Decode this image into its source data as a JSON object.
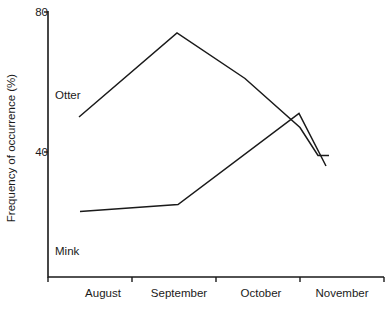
{
  "chart_data": {
    "type": "line",
    "title": "",
    "xlabel": "",
    "ylabel": "Frequency of occurrence (%)",
    "categories": [
      "August",
      "September",
      "October",
      "November"
    ],
    "x_tick_labels": [
      "August",
      "September",
      "October",
      "November"
    ],
    "y_tick_labels": [
      "80",
      "40"
    ],
    "y_ticks": [
      80,
      40
    ],
    "ylim": [
      19,
      80
    ],
    "grid": false,
    "legend_position": "inline-annotation",
    "series": [
      {
        "name": "Otter",
        "label": "Otter",
        "color": "#1a1a1a",
        "x": [
          "August",
          "September",
          "October",
          "October-late",
          "November-mid",
          "November"
        ],
        "values": [
          50,
          74,
          61,
          47,
          39,
          39
        ]
      },
      {
        "name": "Mink",
        "label": "Mink",
        "color": "#1a1a1a",
        "x": [
          "August",
          "September",
          "October-late",
          "November"
        ],
        "values": [
          23,
          25,
          51,
          36
        ]
      }
    ],
    "annotations": [
      {
        "text": "Otter",
        "series": "Otter"
      },
      {
        "text": "Mink",
        "series": "Mink"
      }
    ]
  },
  "axis": {
    "y_title": "Frequency of occurrence (%)",
    "y_tick_80": "80",
    "y_tick_40": "40",
    "x_tick_1": "August",
    "x_tick_2": "September",
    "x_tick_3": "October",
    "x_tick_4": "November"
  },
  "labels": {
    "otter": "Otter",
    "mink": "Mink"
  },
  "colors": {
    "line": "#1a1a1a",
    "axis": "#1a1a1a",
    "background": "#ffffff"
  }
}
